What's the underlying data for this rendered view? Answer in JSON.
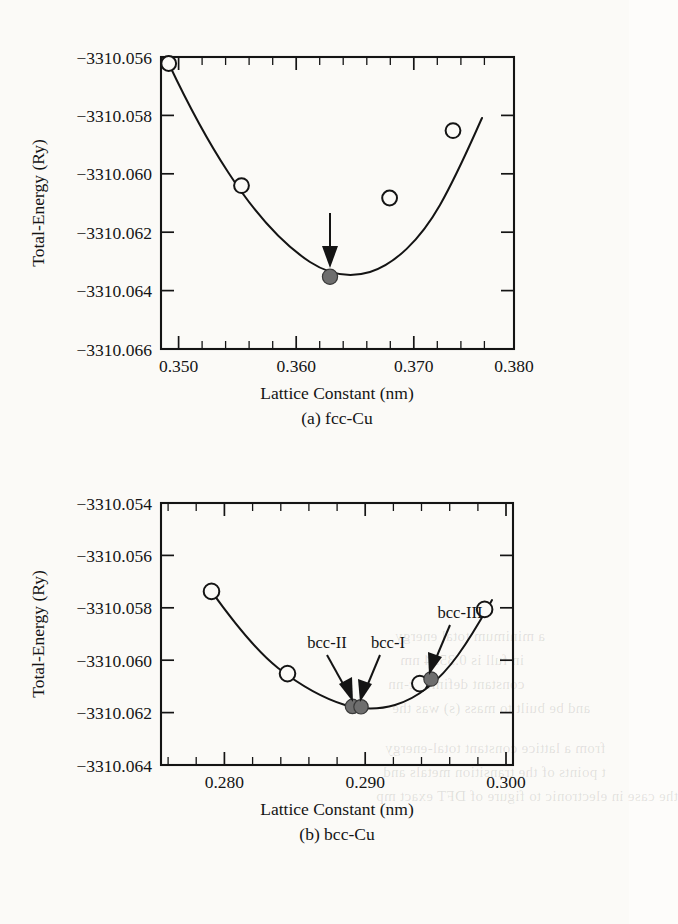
{
  "figure": {
    "panels": [
      {
        "id": "fcc",
        "caption": "(a) fcc-Cu",
        "xlabel": "Lattice Constant (nm)",
        "ylabel": "Total-Energy (Ry)",
        "xticks": [
          "0.350",
          "0.360",
          "0.370",
          "0.380"
        ],
        "yticks": [
          "−3310.056",
          "−3310.058",
          "−3310.060",
          "−3310.062",
          "−3310.064",
          "−3310.066"
        ],
        "annotations": []
      },
      {
        "id": "bcc",
        "caption": "(b) bcc-Cu",
        "xlabel": "Lattice Constant (nm)",
        "ylabel": "Total-Energy (Ry)",
        "xticks": [
          "0.280",
          "0.290",
          "0.300"
        ],
        "yticks": [
          "−3310.054",
          "−3310.056",
          "−3310.058",
          "−3310.060",
          "−3310.062",
          "−3310.064"
        ],
        "annotations": [
          "bcc-II",
          "bcc-I",
          "bcc-III"
        ]
      }
    ]
  },
  "bleed_text": [
    {
      "text": "a minimum total energy",
      "x": 395,
      "y": 628
    },
    {
      "text": "in full is 0.3594 nm",
      "x": 400,
      "y": 652
    },
    {
      "text": "constant definite c-nn",
      "x": 388,
      "y": 676
    },
    {
      "text": "and be built to mass  (s) was the",
      "x": 392,
      "y": 700
    },
    {
      "text": "from a lattice constant total-energy",
      "x": 385,
      "y": 740
    },
    {
      "text": "t points of the transition metals and",
      "x": 383,
      "y": 764
    },
    {
      "text": "the case in electronic to figure of DFT exact mp",
      "x": 376,
      "y": 788
    }
  ],
  "chart_data": [
    {
      "type": "line",
      "panel": "a",
      "title": "(a) fcc-Cu",
      "xlabel": "Lattice Constant (nm)",
      "ylabel": "Total-Energy (Ry)",
      "xlim": [
        0.35,
        0.38
      ],
      "ylim": [
        -3310.066,
        -3310.056
      ],
      "xticks": [
        0.35,
        0.36,
        0.37,
        0.38
      ],
      "yticks": [
        -3310.066,
        -3310.064,
        -3310.062,
        -3310.06,
        -3310.058,
        -3310.056
      ],
      "grid": false,
      "minor_ticks_per_interval": 4,
      "series": [
        {
          "name": "fcc-Cu total energy",
          "marker": "open-circle",
          "x": [
            0.3506,
            0.3568,
            0.3694,
            0.3748
          ],
          "y": [
            -3310.0601,
            -3310.0639,
            -3310.0643,
            -3310.062
          ]
        },
        {
          "name": "fcc-Cu equilibrium",
          "marker": "filled-circle",
          "x": [
            0.3632
          ],
          "y": [
            -3310.0652
          ]
        }
      ],
      "annotations": [
        {
          "type": "arrow",
          "target_x": 0.3632,
          "target_y": -3310.0652,
          "label": ""
        }
      ]
    },
    {
      "type": "line",
      "panel": "b",
      "title": "(b) bcc-Cu",
      "xlabel": "Lattice Constant (nm)",
      "ylabel": "Total-Energy (Ry)",
      "xlim": [
        0.2755,
        0.3005
      ],
      "ylim": [
        -3310.064,
        -3310.054
      ],
      "xticks": [
        0.28,
        0.29,
        0.3
      ],
      "yticks": [
        -3310.064,
        -3310.062,
        -3310.06,
        -3310.058,
        -3310.056,
        -3310.054
      ],
      "grid": false,
      "minor_ticks_per_interval": 4,
      "series": [
        {
          "name": "bcc-Cu total energy",
          "marker": "open-circle",
          "x": [
            0.2786,
            0.284,
            0.2934,
            0.298
          ],
          "y": [
            -3310.0573,
            -3310.061,
            -3310.0614,
            -3310.0591
          ]
        },
        {
          "name": "bcc labeled states",
          "marker": "filled-circle",
          "x": [
            0.2882,
            0.2888,
            0.2938
          ],
          "y": [
            -3310.0622,
            -3310.0622,
            -3310.0612
          ]
        }
      ],
      "annotations": [
        {
          "type": "arrow-label",
          "label": "bcc-II",
          "target_x": 0.2882,
          "target_y": -3310.0622
        },
        {
          "type": "arrow-label",
          "label": "bcc-I",
          "target_x": 0.2888,
          "target_y": -3310.0622
        },
        {
          "type": "arrow-label",
          "label": "bcc-III",
          "target_x": 0.2938,
          "target_y": -3310.0612
        }
      ]
    }
  ]
}
